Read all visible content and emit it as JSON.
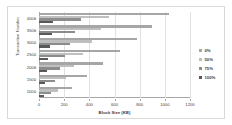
{
  "chart_data": {
    "type": "bar",
    "orientation": "horizontal",
    "title": "",
    "xlabel": "Block Size (KB)",
    "ylabel": "Transaction Number",
    "categories": [
      "1000",
      "1500",
      "2000",
      "2500",
      "3000",
      "3500",
      "4000"
    ],
    "xlim": [
      0,
      1200
    ],
    "xticks": [
      0,
      200,
      400,
      600,
      800,
      1000,
      1200
    ],
    "grid": true,
    "legend_position": "right",
    "series": [
      {
        "name": "0%",
        "color": "#a6a6a6",
        "values": [
          260,
          380,
          510,
          645,
          775,
          900,
          1030
        ]
      },
      {
        "name": "50%",
        "color": "#bfbfbf",
        "values": [
          150,
          215,
          280,
          350,
          420,
          490,
          560
        ]
      },
      {
        "name": "75%",
        "color": "#8c8c8c",
        "values": [
          95,
          130,
          170,
          210,
          250,
          290,
          330
        ]
      },
      {
        "name": "100%",
        "color": "#595959",
        "values": [
          38,
          50,
          62,
          75,
          88,
          100,
          112
        ]
      }
    ]
  },
  "legend": {
    "items": [
      {
        "label": "0%"
      },
      {
        "label": "50%"
      },
      {
        "label": "75%"
      },
      {
        "label": "100%"
      }
    ]
  }
}
